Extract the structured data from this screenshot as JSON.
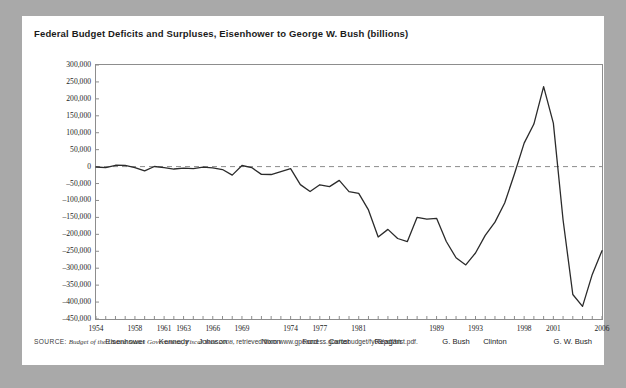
{
  "figure": {
    "title": "Federal Budget Deficits and Surpluses, Eisenhower to George W. Bush (billions)",
    "source_label": "SOURCE:",
    "source_citation": "Budget of the United States Government, Fiscal Year 2008,",
    "source_rest": "retrieved from www.gpoaccess.gov/usbudget/fy08/pdf/hist.pdf.",
    "line_color": "#2b2b2b",
    "zero_line_color": "#8d8d8d",
    "frame_color": "#8d8d8d",
    "background_color": "#a9a9a9",
    "card_color": "#ffffff"
  },
  "chart_data": {
    "type": "line",
    "title": "Federal Budget Deficits and Surpluses, Eisenhower to George W. Bush (billions)",
    "xlabel": "",
    "ylabel": "",
    "ylim": [
      -450000,
      300000
    ],
    "xlim": [
      1954,
      2006
    ],
    "grid": false,
    "legend": "none",
    "zero_reference_line": 0,
    "ytick_labels": [
      "300,000",
      "250,000",
      "200,000",
      "150,000",
      "100,000",
      "50,000",
      "0",
      "–50,000",
      "–100,000",
      "–150,000",
      "–200,000",
      "–250,000",
      "–300,000",
      "–350,000",
      "–400,000",
      "–450,000"
    ],
    "ytick_values": [
      300000,
      250000,
      200000,
      150000,
      100000,
      50000,
      0,
      -50000,
      -100000,
      -150000,
      -200000,
      -250000,
      -300000,
      -350000,
      -400000,
      -450000
    ],
    "xtick_labels": [
      "1954",
      "1958",
      "1961",
      "1963",
      "1966",
      "1969",
      "1974",
      "1977",
      "1981",
      "1989",
      "1993",
      "1998",
      "2001",
      "2006"
    ],
    "xtick_values": [
      1954,
      1958,
      1961,
      1963,
      1966,
      1969,
      1974,
      1977,
      1981,
      1989,
      1993,
      1998,
      2001,
      2006
    ],
    "presidents": [
      {
        "name": "Eisenhower",
        "x": 1957
      },
      {
        "name": "Kennedy",
        "x": 1962
      },
      {
        "name": "Johnson",
        "x": 1966
      },
      {
        "name": "Nixon",
        "x": 1972
      },
      {
        "name": "Ford",
        "x": 1976
      },
      {
        "name": "Carter",
        "x": 1979
      },
      {
        "name": "Reagan",
        "x": 1984
      },
      {
        "name": "G. Bush",
        "x": 1991
      },
      {
        "name": "Clinton",
        "x": 1995
      },
      {
        "name": "G. W. Bush",
        "x": 2003
      }
    ],
    "x": [
      1954,
      1955,
      1956,
      1957,
      1958,
      1959,
      1960,
      1961,
      1962,
      1963,
      1964,
      1965,
      1966,
      1967,
      1968,
      1969,
      1970,
      1971,
      1972,
      1973,
      1974,
      1975,
      1976,
      1977,
      1978,
      1979,
      1980,
      1981,
      1982,
      1983,
      1984,
      1985,
      1986,
      1987,
      1988,
      1989,
      1990,
      1991,
      1992,
      1993,
      1994,
      1995,
      1996,
      1997,
      1998,
      1999,
      2000,
      2001,
      2002,
      2003,
      2004,
      2005,
      2006
    ],
    "values": [
      -1154,
      -3041,
      3947,
      3412,
      -2769,
      -12849,
      301,
      -3335,
      -7146,
      -4756,
      -5915,
      -1411,
      -3698,
      -8643,
      -25161,
      3242,
      -2842,
      -23033,
      -23373,
      -14908,
      -6135,
      -53242,
      -73732,
      -53659,
      -59186,
      -40726,
      -73830,
      -78968,
      -127977,
      -207802,
      -185367,
      -212308,
      -221227,
      -149730,
      -155178,
      -152639,
      -221036,
      -269238,
      -290321,
      -255051,
      -203186,
      -163952,
      -107431,
      -21884,
      69270,
      125610,
      236241,
      128236,
      -157758,
      -377585,
      -412727,
      -318346,
      -248181
    ],
    "series_name": "Federal budget surplus/deficit (millions of dollars)"
  }
}
